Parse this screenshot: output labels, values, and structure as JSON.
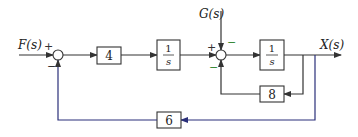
{
  "diagram": {
    "type": "block-diagram",
    "colors": {
      "line": "#333333",
      "feedback_outer": "#2a2f7a",
      "sign_minus_green": "#3a8a3a",
      "sign_default": "#333333"
    },
    "inputs": {
      "F": "F(s)",
      "G": "G(s)"
    },
    "output": "X(s)",
    "blocks": {
      "gain4": "4",
      "integrator1_num": "1",
      "integrator1_den": "s",
      "integrator2_num": "1",
      "integrator2_den": "s",
      "gain8": "8",
      "gain6": "6"
    },
    "junction1": {
      "sign_top": "+",
      "sign_bottom": "−"
    },
    "junction2": {
      "sign_left": "+",
      "sign_top": "−",
      "sign_bottom": "−"
    }
  }
}
